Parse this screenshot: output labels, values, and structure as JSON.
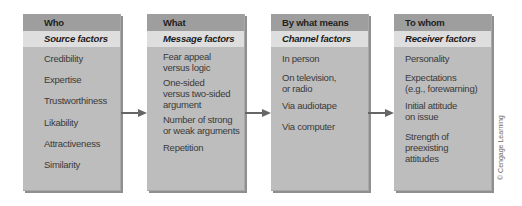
{
  "diagram": {
    "boxes": [
      {
        "header": "Who",
        "subheader": "Source factors",
        "items": [
          "Credibility",
          "Expertise",
          "Trustworthiness",
          "Likability",
          "Attractiveness",
          "Similarity"
        ]
      },
      {
        "header": "What",
        "subheader": "Message factors",
        "items": [
          "Fear appeal\nversus logic",
          "One-sided\nversus two-sided\nargument",
          "Number of strong\nor weak arguments",
          "Repetition"
        ]
      },
      {
        "header": "By what means",
        "subheader": "Channel factors",
        "items": [
          "In person",
          "On television,\nor radio",
          "Via audiotape",
          "Via computer"
        ]
      },
      {
        "header": "To whom",
        "subheader": "Receiver factors",
        "items": [
          "Personality",
          "Expectations\n(e.g., forewarning)",
          "Initial attitude\non issue",
          "Strength of\npreexisting\nattitudes"
        ]
      }
    ],
    "arrows": [
      "source-to-message",
      "message-to-channel",
      "channel-to-receiver"
    ],
    "credit": "© Cengage Learning",
    "colors": {
      "header_bg": "#9e9e9e",
      "subheader_bg": "#dedede",
      "body_bg": "#bdbdbd",
      "arrow": "#666666"
    }
  }
}
